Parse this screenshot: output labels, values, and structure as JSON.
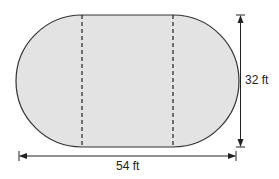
{
  "figure": {
    "shape": "rectangle with two semicircular ends (stadium)",
    "fill_color": "#e3e3e3",
    "stroke_color": "#333333",
    "dimensions": {
      "height_label": "32 ft",
      "width_label": "54 ft"
    },
    "dashed_dividers": 2
  }
}
